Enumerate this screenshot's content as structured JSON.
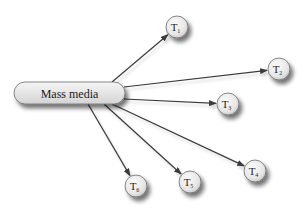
{
  "diagram": {
    "hub": {
      "label": "Mass media",
      "x": 14,
      "y": 82,
      "width": 111,
      "height": 22
    },
    "targets": [
      {
        "letter": "T",
        "sub": "1",
        "cx": 177,
        "cy": 27,
        "from": [
          112,
          82
        ]
      },
      {
        "letter": "T",
        "sub": "2",
        "cx": 279,
        "cy": 69,
        "from": [
          124,
          87
        ]
      },
      {
        "letter": "T",
        "sub": "3",
        "cx": 228,
        "cy": 104,
        "from": [
          124,
          99
        ]
      },
      {
        "letter": "T",
        "sub": "4",
        "cx": 255,
        "cy": 171,
        "from": [
          112,
          104
        ]
      },
      {
        "letter": "T",
        "sub": "5",
        "cx": 190,
        "cy": 182,
        "from": [
          104,
          104
        ]
      },
      {
        "letter": "T",
        "sub": "6",
        "cx": 136,
        "cy": 186,
        "from": [
          88,
          104
        ]
      }
    ],
    "radius": 11,
    "colors": {
      "line": "#3a3a3a",
      "node_fill_light": "#f4f4f4",
      "node_fill_dark": "#cfcfcf",
      "node_stroke": "#6a6a6a",
      "shadow": "#9a9a9a"
    }
  }
}
